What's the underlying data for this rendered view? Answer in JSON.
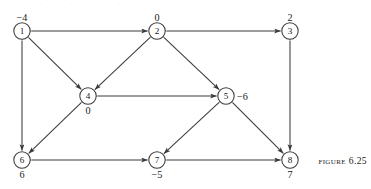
{
  "figure": {
    "caption_word": "Figure",
    "caption_number": "6.25",
    "page_bleed_text": "·  ·   ·     ·    ·      ·       ·      ·      ·"
  },
  "graph": {
    "type": "directed-graph",
    "node_radius": 8.2,
    "nodes": [
      {
        "id": "1",
        "value": "−4",
        "cx": 22,
        "cy": 31,
        "label_pos": "above",
        "label_dx": 0,
        "label_dy": -14
      },
      {
        "id": "2",
        "value": "0",
        "cx": 157,
        "cy": 31,
        "label_pos": "above",
        "label_dx": 0,
        "label_dy": -14
      },
      {
        "id": "3",
        "value": "2",
        "cx": 290,
        "cy": 31,
        "label_pos": "above",
        "label_dx": 0,
        "label_dy": -14
      },
      {
        "id": "4",
        "value": "0",
        "cx": 88,
        "cy": 96,
        "label_pos": "below",
        "label_dx": 0,
        "label_dy": 14
      },
      {
        "id": "5",
        "value": "−6",
        "cx": 226,
        "cy": 96,
        "label_pos": "right",
        "label_dx": 11,
        "label_dy": 0
      },
      {
        "id": "6",
        "value": "6",
        "cx": 22,
        "cy": 160,
        "label_pos": "below",
        "label_dx": 0,
        "label_dy": 14
      },
      {
        "id": "7",
        "value": "−5",
        "cx": 157,
        "cy": 160,
        "label_pos": "below",
        "label_dx": 0,
        "label_dy": 14
      },
      {
        "id": "8",
        "value": "7",
        "cx": 290,
        "cy": 160,
        "label_pos": "below",
        "label_dx": 0,
        "label_dy": 14
      }
    ],
    "edges": [
      {
        "from": "1",
        "to": "2",
        "bidirectional": true
      },
      {
        "from": "2",
        "to": "3",
        "bidirectional": true
      },
      {
        "from": "1",
        "to": "6",
        "bidirectional": true
      },
      {
        "from": "3",
        "to": "8",
        "bidirectional": true
      },
      {
        "from": "4",
        "to": "5",
        "bidirectional": true
      },
      {
        "from": "6",
        "to": "7",
        "bidirectional": true
      },
      {
        "from": "7",
        "to": "8",
        "bidirectional": true
      },
      {
        "from": "1",
        "to": "4",
        "bidirectional": true
      },
      {
        "from": "2",
        "to": "4",
        "bidirectional": true
      },
      {
        "from": "2",
        "to": "5",
        "bidirectional": true
      },
      {
        "from": "4",
        "to": "6",
        "bidirectional": true
      },
      {
        "from": "5",
        "to": "7",
        "bidirectional": true
      },
      {
        "from": "5",
        "to": "8",
        "bidirectional": true
      }
    ]
  },
  "colors": {
    "stroke": "#3a3a3a",
    "text": "#1a1a1a",
    "background": "#ffffff",
    "bleed": "#ededed"
  }
}
